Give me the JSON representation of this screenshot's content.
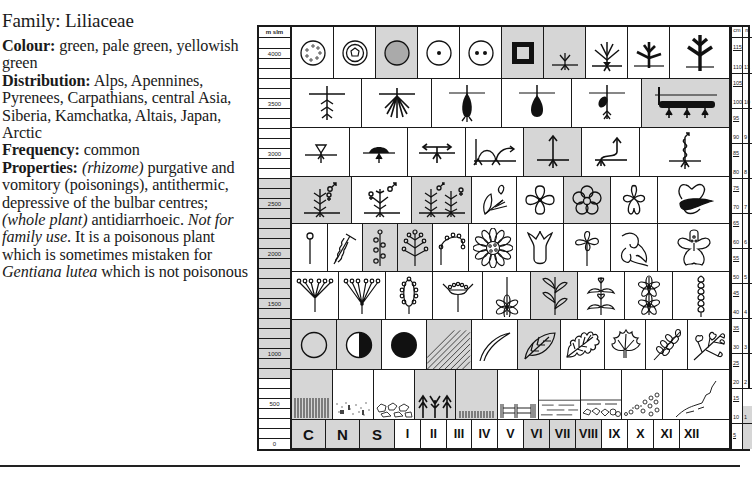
{
  "text": {
    "family": "Family: Liliaceae",
    "colour_label": "Colour:",
    "colour_value": " green, pale green, yellowish green",
    "distribution_label": "Distribution:",
    "distribution_value": " Alps, Apennines, Pyrenees, Carpathians, central Asia, Siberia, Kamchatka, Altais, Japan, Arctic",
    "frequency_label": "Frequency:",
    "frequency_value": " common",
    "properties_label": "Properties:",
    "properties_part1_italic": "(rhizome)",
    "properties_part2": " purgative and vomitory (poisonings), antithermic, depressive of the bulbar centres; ",
    "properties_part3_italic": "(whole plant)",
    "properties_part4": " antidiarrhoeic. ",
    "properties_part5_italic": "Not for family use",
    "properties_part6": ". It is a poisonous plant which is sometimes mistaken for ",
    "properties_part7_italic": "Gentiana lutea",
    "properties_part8": " which is not poisonous"
  },
  "chart": {
    "altitude_scale": {
      "header": "m slm",
      "labels": [
        "4000",
        "3500",
        "3000",
        "2500",
        "2000",
        "1500",
        "1000",
        "500",
        "0"
      ],
      "highlighted_range": [
        "600",
        "2700"
      ]
    },
    "height_scale": {
      "header_cm": "cm",
      "header_m": "m",
      "cm_labels": [
        "115",
        "110",
        "105",
        "100",
        "95",
        "90",
        "85",
        "80",
        "75",
        "70",
        "65",
        "60",
        "55",
        "50",
        "45",
        "40",
        "35",
        "30",
        "25",
        "20",
        "15",
        "10",
        "5"
      ],
      "m_labels": [
        "11",
        "10",
        "9",
        "8",
        "7",
        "6",
        "5",
        "4",
        "3",
        "2",
        "1"
      ],
      "highlighted": "1"
    },
    "months": [
      "I",
      "II",
      "III",
      "IV",
      "V",
      "VI",
      "VII",
      "VIII",
      "IX",
      "X",
      "XI",
      "XII"
    ],
    "months_highlighted": [
      "VI",
      "VII",
      "VIII"
    ],
    "exposure": [
      "C",
      "N",
      "S"
    ],
    "exposure_highlighted": [
      "C",
      "N",
      "S"
    ],
    "highlighted_symbols": [
      "sand-granular-soil",
      "herbaceous-perennial",
      "rhizome",
      "upright-stem",
      "dioecious-hermaphrodite",
      "raceme",
      "spike",
      "five-petal-flower",
      "opposite-leaves",
      "full-sun",
      "half-shade",
      "shade-grassland",
      "ovate-leaf",
      "grassland-habitat",
      "coniferous-forest",
      "meadow-habitat"
    ]
  }
}
